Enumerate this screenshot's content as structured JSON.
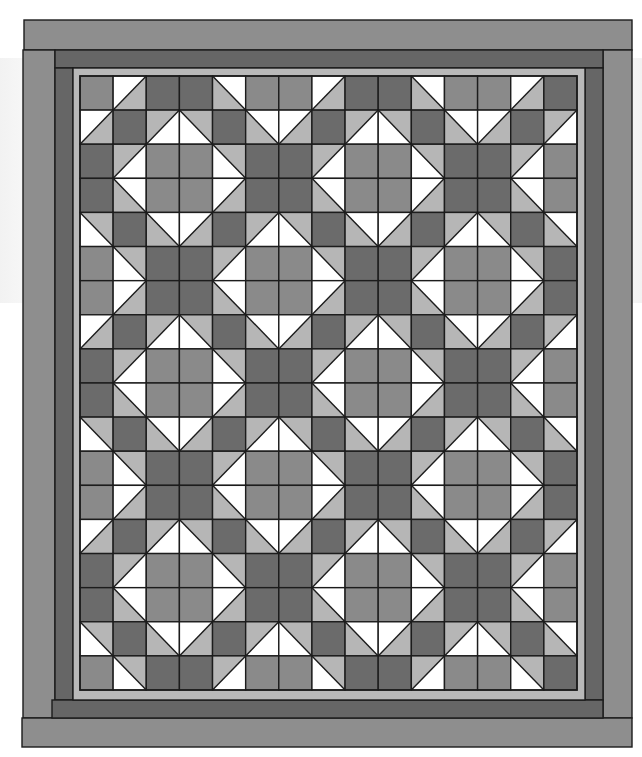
{
  "figure": {
    "type": "quilt-layout-diagram",
    "colors": {
      "outer_border": "#8e8e8e",
      "dark_border": "#666666",
      "light_border": "#b9b9b9",
      "medium": "#8a8a8a",
      "dark": "#6b6b6b",
      "light": "#b6b6b6",
      "white": "#ffffff",
      "line": "#1c1c1c"
    },
    "grid": {
      "cols": 15,
      "rows": 18,
      "legend": {
        "M": "medium gray square",
        "D": "dark gray square",
        "TL": "half-square triangle, white at top-left, light gray at bottom-right",
        "TR": "half-square triangle, white at top-right, light gray at bottom-left",
        "BL": "half-square triangle, white at bottom-left, light gray at top-right",
        "BR": "half-square triangle, white at bottom-right, light gray at top-left"
      },
      "cells": [
        "M TL D D TR M M TL D D TR M M TL D",
        "TL D BR BL D TR TL D BR BL D TR TL D BR",
        "D BR M M BL D D BR M M BL D D BR M",
        "D TR M M TL D D TR M M TL D D TR M",
        "BL D TR TL D BR BL D TR TL D BR BL D TR",
        "M BL D D BR M M BL D D BR M M BL D",
        "M TL D D TR M M TL D D TR M M TL D",
        "TL D BR BL D TR TL D BR BL D TR TL D BR",
        "D BR M M BL D D BR M M BL D D BR M",
        "D TR M M TL D D TR M M TL D D TR M",
        "BL D TR TL D BR BL D TR TL D BR BL D TR",
        "M BL D D BR M M BL D D BR M M BL D",
        "M TL D D TR M M TL D D TR M M TL D",
        "TL D BR BL D TR TL D BR BL D TR TL D BR",
        "D BR M M BL D D BR M M BL D D BR M",
        "D TR M M TL D D TR M M TL D D TR M",
        "BL D TR TL D BR BL D TR TL D BR BL D TR",
        "M BL D D BR M M BL D D BR M M BL D"
      ]
    },
    "borders": [
      {
        "name": "outer-border",
        "color_key": "outer_border"
      },
      {
        "name": "dark-inner-border",
        "color_key": "dark_border"
      },
      {
        "name": "light-narrow-border",
        "color_key": "light_border"
      }
    ]
  }
}
